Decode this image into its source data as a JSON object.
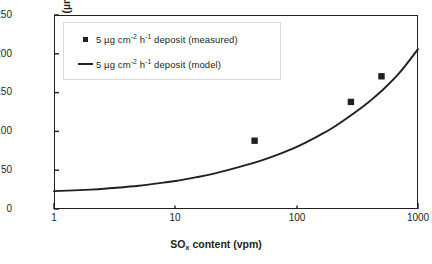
{
  "chart_data": {
    "type": "line",
    "title": "",
    "xlabel": "SOx content (vpm)",
    "xlabel_base": "SO",
    "xlabel_sub": "x",
    "xlabel_rest": " content (vpm)",
    "ylabel": "Sound metal loss (µm)",
    "xscale": "log",
    "yscale": "linear",
    "xlim": [
      1,
      1000
    ],
    "ylim": [
      0,
      250
    ],
    "grid": false,
    "legend_position": "upper-left",
    "xticks": [
      1,
      10,
      100,
      1000
    ],
    "xtick_labels": [
      "1",
      "10",
      "100",
      "1000"
    ],
    "yticks": [
      0,
      50,
      100,
      150,
      200,
      250
    ],
    "ytick_labels": [
      "0",
      "50",
      "100",
      "150",
      "200",
      "250"
    ],
    "series": [
      {
        "name": "5 µg cm-2 h-1 deposit (measured)",
        "type": "scatter",
        "marker": "square",
        "color": "#231f20",
        "points": [
          {
            "x": 45,
            "y": 88
          },
          {
            "x": 280,
            "y": 138
          },
          {
            "x": 500,
            "y": 171
          }
        ]
      },
      {
        "name": "5 µg cm-2 h-1 deposit (model)",
        "type": "line",
        "color": "#231f20",
        "points": [
          {
            "x": 1,
            "y": 23
          },
          {
            "x": 2,
            "y": 25
          },
          {
            "x": 3,
            "y": 27
          },
          {
            "x": 5,
            "y": 30
          },
          {
            "x": 8,
            "y": 34
          },
          {
            "x": 10,
            "y": 36
          },
          {
            "x": 15,
            "y": 41
          },
          {
            "x": 20,
            "y": 45
          },
          {
            "x": 30,
            "y": 52
          },
          {
            "x": 50,
            "y": 62
          },
          {
            "x": 70,
            "y": 70
          },
          {
            "x": 100,
            "y": 80
          },
          {
            "x": 150,
            "y": 94
          },
          {
            "x": 200,
            "y": 105
          },
          {
            "x": 300,
            "y": 124
          },
          {
            "x": 400,
            "y": 139
          },
          {
            "x": 500,
            "y": 152
          },
          {
            "x": 700,
            "y": 175
          },
          {
            "x": 1000,
            "y": 206
          }
        ]
      }
    ]
  },
  "legend": {
    "items": [
      {
        "key": "square",
        "amount": "5 µg cm",
        "sup1": "-2",
        "unit2": " h",
        "sup2": "-1",
        "tail": " deposit (measured)"
      },
      {
        "key": "line",
        "amount": "5 µg cm",
        "sup1": "-2",
        "unit2": " h",
        "sup2": "-1",
        "tail": " deposit (model)"
      }
    ]
  },
  "axes": {
    "y_title": "Sound metal loss (µm)",
    "x_title_base": "SO",
    "x_title_sub": "x",
    "x_title_rest": " content (vpm)"
  },
  "colors": {
    "ink": "#231f20",
    "legend_border": "#d9d9d9",
    "background": "#ffffff"
  }
}
